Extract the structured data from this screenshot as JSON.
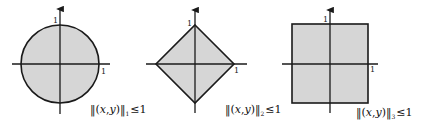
{
  "colors": {
    "fill": "#d6d6d6",
    "stroke": "#1a1a1a",
    "background": "#ffffff"
  },
  "figures": [
    {
      "shape": "circle",
      "tick_x": "1",
      "tick_y": "1",
      "label": {
        "open": "‖(",
        "x": "x",
        "comma": ",",
        "y": "y",
        "close": ")‖",
        "subscript": "1",
        "rel": "≤",
        "value": "1"
      }
    },
    {
      "shape": "diamond",
      "tick_x": "1",
      "tick_y": "1",
      "label": {
        "open": "‖(",
        "x": "x",
        "comma": ",",
        "y": "y",
        "close": ")‖",
        "subscript": "2",
        "rel": "≤",
        "value": "1"
      }
    },
    {
      "shape": "square",
      "tick_x": "1",
      "tick_y": "1",
      "label": {
        "open": "‖(",
        "x": "x",
        "comma": ",",
        "y": "y",
        "close": ")‖",
        "subscript": "3",
        "rel": "≤",
        "value": "1"
      }
    }
  ]
}
